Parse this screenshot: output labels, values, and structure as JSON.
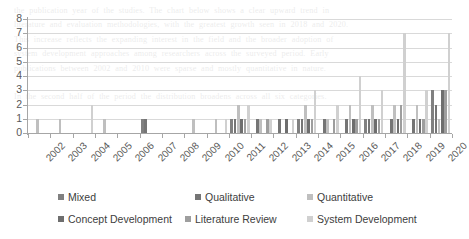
{
  "chart_data": {
    "type": "bar",
    "title": "",
    "xlabel": "",
    "ylabel": "",
    "ylim": [
      0,
      8
    ],
    "yticks": [
      0,
      1,
      2,
      3,
      4,
      5,
      6,
      7,
      8
    ],
    "grid": true,
    "legend_position": "bottom",
    "categories": [
      "2002",
      "2003",
      "2004",
      "2005",
      "2006",
      "2007",
      "2008",
      "2009",
      "2010",
      "2011",
      "2012",
      "2013",
      "2014",
      "2015",
      "2016",
      "2017",
      "2018",
      "2019",
      "2020"
    ],
    "series": [
      {
        "name": "Mixed",
        "color": "#808080",
        "values": [
          0,
          0,
          0,
          0,
          0,
          1,
          0,
          0,
          0,
          1,
          0,
          0,
          1,
          0,
          0,
          1,
          0,
          0,
          3
        ]
      },
      {
        "name": "Qualitative",
        "color": "#757575",
        "values": [
          0,
          0,
          0,
          0,
          0,
          1,
          0,
          0,
          0,
          1,
          1,
          1,
          1,
          1,
          1,
          1,
          1,
          1,
          2
        ]
      },
      {
        "name": "Quantitative",
        "color": "#bfbfbf",
        "values": [
          1,
          1,
          0,
          1,
          0,
          0,
          0,
          1,
          1,
          2,
          1,
          0,
          2,
          1,
          2,
          2,
          2,
          2,
          1
        ]
      },
      {
        "name": "Concept Development",
        "color": "#6e6e6e",
        "values": [
          0,
          0,
          0,
          0,
          0,
          0,
          0,
          0,
          0,
          1,
          0,
          1,
          1,
          0,
          1,
          1,
          1,
          1,
          3
        ]
      },
      {
        "name": "Literature Review",
        "color": "#9e9e9e",
        "values": [
          0,
          0,
          0,
          0,
          0,
          0,
          0,
          0,
          0,
          1,
          1,
          0,
          1,
          1,
          1,
          1,
          2,
          1,
          3
        ]
      },
      {
        "name": "System Development",
        "color": "#d0d0d0",
        "values": [
          0,
          0,
          2,
          0,
          0,
          0,
          0,
          0,
          1,
          2,
          1,
          1,
          3,
          2,
          4,
          3,
          7,
          3,
          7
        ]
      }
    ]
  },
  "legend": {
    "items": [
      {
        "label": "Mixed",
        "color": "#808080"
      },
      {
        "label": "Qualitative",
        "color": "#757575"
      },
      {
        "label": "Quantitative",
        "color": "#bfbfbf"
      },
      {
        "label": "Concept Development",
        "color": "#6e6e6e"
      },
      {
        "label": "Literature Review",
        "color": "#9e9e9e"
      },
      {
        "label": "System Development",
        "color": "#d0d0d0"
      }
    ]
  },
  "background_text": "the publication year of the studies. The chart below shows a clear upward trend in\nliterature and evaluation methodologies, with the greatest growth seen in 2018 and 2020.\nThis increase reflects the expanding interest in the field and the broader adoption of\nsystem development approaches among researchers across the surveyed period. Early\npublications between 2002 and 2010 were sparse and mostly quantitative in nature.\n\nIn the second half of the period the distribution broadens across all six categories."
}
